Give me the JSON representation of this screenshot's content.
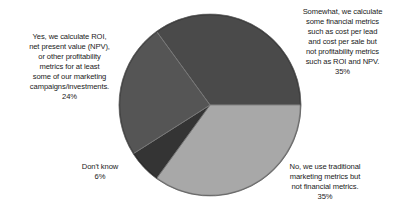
{
  "chart_data": {
    "type": "pie",
    "title": "",
    "start_angle_deg": -126,
    "direction": "clockwise",
    "slices": [
      {
        "label": "Somewhat, we calculate some financial metrics such as cost per lead and cost per sale but not profitability metrics such as ROI and NPV.",
        "value": 35,
        "color": "#4a4a4a"
      },
      {
        "label": "No, we use traditional marketing metrics but not financial metrics.",
        "value": 35,
        "color": "#a8a8a8"
      },
      {
        "label": "Don't know",
        "value": 6,
        "color": "#343434"
      },
      {
        "label": "Yes, we calculate ROI, net present value (NPV), or other profitability metrics for at least some of our marketing campaigns/investments.",
        "value": 24,
        "color": "#555555"
      }
    ]
  },
  "labels": {
    "somewhat": {
      "lines": [
        "Somewhat, we calculate",
        "some financial metrics",
        "such as cost per lead",
        "and cost per sale but",
        "not profitability metrics",
        "such as ROI and NPV."
      ],
      "pct": "35%"
    },
    "no": {
      "lines": [
        "No, we use traditional",
        "marketing metrics but",
        "not financial metrics."
      ],
      "pct": "35%"
    },
    "dontknow": {
      "lines": [
        "Don't know"
      ],
      "pct": "6%"
    },
    "yes": {
      "lines": [
        "Yes, we calculate ROI,",
        "net present value (NPV),",
        "or other profitability",
        "metrics for at least",
        "some of our marketing",
        "campaigns/investments."
      ],
      "pct": "24%"
    }
  }
}
